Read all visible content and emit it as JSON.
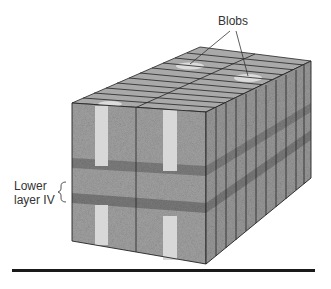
{
  "labels": {
    "blobs": "Blobs",
    "lower_layer_line1": "Lower",
    "lower_layer_line2": "layer IV"
  },
  "colors": {
    "top_face": "#a8a8a8",
    "front_face": "#9c9c9c",
    "side_face": "#8f8f8f",
    "blob": "#dcdcdc",
    "band": "#7c7c7c",
    "line": "#222222",
    "rule": "#1a1a1a"
  }
}
